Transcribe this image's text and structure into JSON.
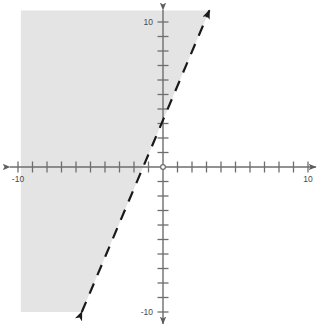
{
  "figure": {
    "title": "",
    "kind": "cartesian-coordinate-plane-with-shaded-inequality",
    "background_color": "#ffffff"
  },
  "axes": {
    "x_axis": {
      "label": "",
      "min": -11.0,
      "max": 11.2,
      "tick_interval": 1,
      "labeled_ticks": [
        {
          "value": -10,
          "text": "-10"
        },
        {
          "value": 10,
          "text": "10"
        }
      ],
      "color": "#6e6e6e",
      "arrowheads": "both"
    },
    "y_axis": {
      "label": "",
      "min": -11.4,
      "max": 11.0,
      "tick_interval": 1,
      "labeled_ticks": [
        {
          "value": 10,
          "text": "10"
        },
        {
          "value": -10,
          "text": "-10"
        }
      ],
      "color": "#6e6e6e",
      "arrowheads": "both"
    },
    "origin_marker": "open-circle",
    "grid": false
  },
  "chart_data": {
    "type": "line",
    "title": "",
    "xlabel": "",
    "ylabel": "",
    "xlim": [
      -11.0,
      11.2
    ],
    "ylim": [
      -11.4,
      11.0
    ],
    "grid": false,
    "legend": "none",
    "series": [
      {
        "name": "boundary-line",
        "style": "dashed",
        "color": "#1a1a1a",
        "line_width": 2.2,
        "slope": 2.38,
        "y_intercept": 3.35,
        "x_intercept": -1.41,
        "equation": "y = 2.38x + 3.35",
        "arrowheads": "both",
        "endpoints": [
          {
            "x": -5.6,
            "y": -10.0
          },
          {
            "x": 3.2,
            "y": 10.8
          }
        ],
        "points": [
          {
            "x": -5.6,
            "y": -10.0
          },
          {
            "x": -4.0,
            "y": -6.2
          },
          {
            "x": -2.0,
            "y": -1.4
          },
          {
            "x": -1.41,
            "y": 0.0
          },
          {
            "x": 0.0,
            "y": 3.35
          },
          {
            "x": 2.0,
            "y": 8.1
          },
          {
            "x": 3.2,
            "y": 10.8
          }
        ]
      }
    ],
    "shaded_region": {
      "name": "solution-region",
      "description": "region to the left of / above the dashed boundary line",
      "inequality": "y > 2.38x + 3.35",
      "fill_color": "#e4e4e4",
      "boundary_included": false,
      "polygon_points": [
        {
          "x": -9.8,
          "y": 10.8
        },
        {
          "x": 3.2,
          "y": 10.8
        },
        {
          "x": -5.6,
          "y": -10.0
        },
        {
          "x": -9.8,
          "y": -10.0
        }
      ]
    }
  },
  "colors": {
    "shading": "#e4e4e4",
    "axis": "#6e6e6e",
    "line": "#1a1a1a",
    "tick_text": "#4a4a4a",
    "background": "#ffffff"
  }
}
